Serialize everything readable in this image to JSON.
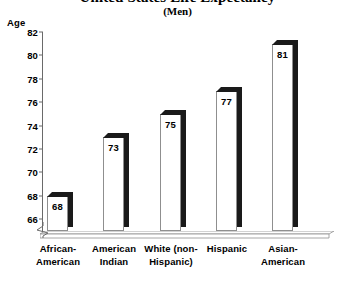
{
  "chart_data": {
    "type": "bar",
    "title": "United States Life Expectancy",
    "subtitle": "(Men)",
    "categories": [
      "African-\nAmerican",
      "American\nIndian",
      "White (non-\nHispanic)",
      "Hispanic",
      "Asian-\nAmerican"
    ],
    "values": [
      68,
      73,
      75,
      77,
      81
    ],
    "value_labels": [
      "68",
      "73",
      "75",
      "77",
      "81"
    ],
    "xlabel": "",
    "ylabel": "Age",
    "ylim": [
      65,
      82
    ],
    "yticks": [
      82,
      80,
      78,
      76,
      74,
      72,
      70,
      68,
      66
    ],
    "ytick_labels": [
      "82",
      "80",
      "78",
      "76",
      "74",
      "72",
      "70",
      "68",
      "66"
    ],
    "grid": false,
    "legend": "none",
    "axis_break": true,
    "style_3d": true
  },
  "colors": {
    "bar_face": "#ffffff",
    "bar_shadow": "#1a1a1a",
    "axis": "#6a6a6a",
    "text": "#000000",
    "background": "#ffffff"
  }
}
